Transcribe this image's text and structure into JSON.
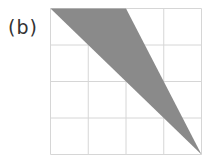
{
  "figure": {
    "label": "(b)",
    "grid": {
      "rows": 4,
      "cols": 4,
      "x0": 50.5,
      "y0": 8.5,
      "x1": 201.5,
      "y1": 154.5,
      "line_color": "#d6d6d6"
    },
    "shape": {
      "type": "triangle",
      "vertices_grid_units": [
        [
          0,
          0
        ],
        [
          2,
          0
        ],
        [
          4,
          4
        ]
      ],
      "fill": "#8a8a8a"
    }
  }
}
